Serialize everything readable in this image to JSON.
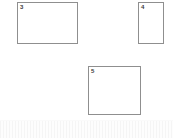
{
  "canvas": {
    "width": 173,
    "height": 138,
    "background_color": "#ffffff"
  },
  "style": {
    "box_border_color": "#8f8f8f",
    "box_fill_color": "#ffffff",
    "label_color": "#3a3a3a",
    "band_color": "#fbfbfb"
  },
  "boxes": [
    {
      "label": "3",
      "name": "page-box-3",
      "x": 17,
      "y": 2,
      "width": 61,
      "height": 42
    },
    {
      "label": "4",
      "name": "page-box-4",
      "x": 138,
      "y": 2,
      "width": 26,
      "height": 42
    },
    {
      "label": "5",
      "name": "page-box-5",
      "x": 88,
      "y": 66,
      "width": 53,
      "height": 49
    }
  ],
  "bottom_band": {
    "label": "",
    "height": 17
  }
}
